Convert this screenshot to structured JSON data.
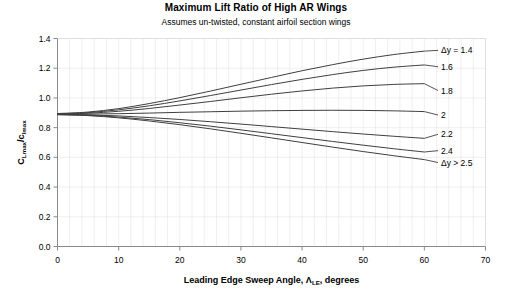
{
  "chart_data": {
    "type": "line",
    "title": "Maximum Lift Ratio of High AR Wings",
    "subtitle": "Assumes un-twisted, constant airfoil section wings",
    "xlabel": "Leading Edge Sweep Angle, ΛLE, degrees",
    "xlabel_main": "Leading Edge Sweep Angle, Λ",
    "xlabel_sub": "LE",
    "xlabel_tail": ", degrees",
    "ylabel": "CLmax/clmax",
    "ylabel_parts": [
      "C",
      "Lmax",
      "/c",
      "lmax"
    ],
    "xlim": [
      0,
      70
    ],
    "ylim": [
      0.0,
      1.4
    ],
    "xticks": [
      0,
      10,
      20,
      30,
      40,
      50,
      60,
      70
    ],
    "xtick_labels": [
      "0",
      "10",
      "20",
      "30",
      "40",
      "50",
      "60",
      "70"
    ],
    "yticks": [
      0.0,
      0.2,
      0.4,
      0.6,
      0.8,
      1.0,
      1.2,
      1.4
    ],
    "ytick_labels": [
      "0.0",
      "0.2",
      "0.4",
      "0.6",
      "0.8",
      "1.0",
      "1.2",
      "1.4"
    ],
    "grid": {
      "x_minor_step": 2,
      "y_minor_step": 0.2,
      "visible": true,
      "color": "#e8e8e8"
    },
    "legend_position": "right-inline-annotations",
    "line_color": "#3f3f3f",
    "x_common": [
      0,
      5,
      10,
      15,
      20,
      25,
      30,
      35,
      40,
      45,
      50,
      55,
      60
    ],
    "series": [
      {
        "name": "Δy = 1.4",
        "label": "Δy = 1.4",
        "label_y": 1.32,
        "values": [
          0.895,
          0.905,
          0.928,
          0.962,
          1.002,
          1.046,
          1.092,
          1.138,
          1.183,
          1.224,
          1.261,
          1.292,
          1.315
        ]
      },
      {
        "name": "1.6",
        "label": "1.6",
        "label_y": 1.21,
        "values": [
          0.893,
          0.901,
          0.92,
          0.947,
          0.98,
          1.016,
          1.053,
          1.09,
          1.125,
          1.157,
          1.185,
          1.207,
          1.222
        ]
      },
      {
        "name": "1.8",
        "label": "1.8",
        "label_y": 1.05,
        "values": [
          0.892,
          0.897,
          0.91,
          0.929,
          0.952,
          0.976,
          1.001,
          1.025,
          1.047,
          1.066,
          1.081,
          1.091,
          1.096
        ]
      },
      {
        "name": "2",
        "label": "2",
        "label_y": 0.885,
        "values": [
          0.89,
          0.891,
          0.894,
          0.898,
          0.903,
          0.907,
          0.911,
          0.914,
          0.916,
          0.917,
          0.916,
          0.913,
          0.908
        ]
      },
      {
        "name": "2.2",
        "label": "2.2",
        "label_y": 0.755,
        "values": [
          0.889,
          0.886,
          0.879,
          0.868,
          0.855,
          0.84,
          0.824,
          0.807,
          0.79,
          0.773,
          0.757,
          0.742,
          0.728
        ]
      },
      {
        "name": "2.4",
        "label": "2.4",
        "label_y": 0.645,
        "values": [
          0.888,
          0.883,
          0.871,
          0.854,
          0.833,
          0.81,
          0.785,
          0.759,
          0.733,
          0.707,
          0.682,
          0.658,
          0.636
        ]
      },
      {
        "name": "Δy > 2.5",
        "label": "Δy > 2.5",
        "label_y": 0.565,
        "values": [
          0.887,
          0.881,
          0.866,
          0.845,
          0.82,
          0.792,
          0.762,
          0.731,
          0.7,
          0.669,
          0.639,
          0.611,
          0.585
        ]
      }
    ]
  }
}
